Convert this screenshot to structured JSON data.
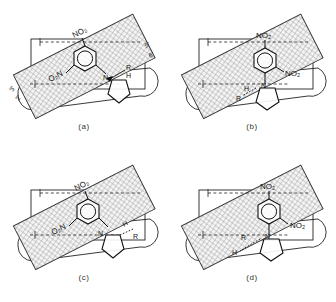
{
  "figure": {
    "panel_count": 4
  },
  "shared": {
    "labels": {
      "nitro_up": "NO2",
      "nitro_reversed": "O2N",
      "nitro_side": "NO2",
      "ring_nitrogen": "N",
      "substituent": "R",
      "hydrogen": "H",
      "prime_5": "5'",
      "prime_6": "6'",
      "prime_3": "3'",
      "prime_2": "2'"
    },
    "colors": {
      "ink": "#111111",
      "hatch": "#7d7d7d",
      "hatch_fill": "#f2f2f2",
      "outline": "#222222",
      "caption": "#333333"
    },
    "geometry": {
      "band_rotation_deg": -27,
      "band_label": "cross-hatched binding band",
      "rectangle_label": "receptor rectangle",
      "stadium_label": "rounded pocket outline"
    }
  },
  "panels": [
    {
      "id": "a",
      "caption": "(a)",
      "nitro_top": "NO2",
      "nitro_bottom": "O2N",
      "nitrogen": "N",
      "substituent": "R",
      "hydrogen": "H",
      "edge_marks": [
        "5'",
        "6'",
        "3'",
        "2'"
      ],
      "nitro_top_rotation": -27,
      "nitro_bottom_rotation": -27,
      "ring_orientation": "phenyl ring with inner aromatic circle",
      "pyrrolidine": "five-membered ring below right"
    },
    {
      "id": "b",
      "caption": "(b)",
      "nitro_top": "NO2",
      "nitro_bottom": "NO2",
      "nitrogen": "N",
      "substituent": "R",
      "hydrogen": "H",
      "edge_marks": [],
      "nitro_top_rotation": 0,
      "nitro_bottom_rotation": 0,
      "ring_orientation": "phenyl ring with inner aromatic circle",
      "pyrrolidine": "five-membered ring below right"
    },
    {
      "id": "c",
      "caption": "(c)",
      "nitro_top": "NO2",
      "nitro_bottom": "O2N",
      "nitrogen": "N",
      "substituent": "R",
      "hydrogen": "H",
      "edge_marks": [],
      "nitro_top_rotation": -27,
      "nitro_bottom_rotation": -27,
      "ring_orientation": "phenyl ring with inner aromatic circle",
      "pyrrolidine": "five-membered ring below right"
    },
    {
      "id": "d",
      "caption": "(d)",
      "nitro_top": "NO2",
      "nitro_bottom": "NO2",
      "nitrogen": "N",
      "substituent": "R",
      "hydrogen": "H",
      "edge_marks": [],
      "nitro_top_rotation": 0,
      "nitro_bottom_rotation": 0,
      "ring_orientation": "phenyl ring with inner aromatic circle",
      "pyrrolidine": "five-membered ring below left"
    }
  ]
}
